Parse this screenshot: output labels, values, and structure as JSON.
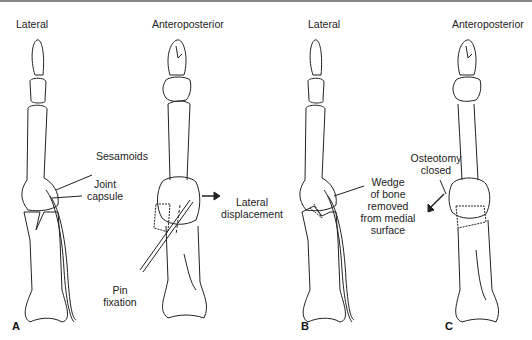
{
  "figure": {
    "panels": [
      {
        "id": "A",
        "label": "A",
        "views": [
          {
            "title": "Lateral",
            "annotations": [
              "Sesamoids",
              "Joint",
              "capsule"
            ]
          },
          {
            "title": "Anteroposterior",
            "annotations": [
              "Lateral",
              "displacement",
              "Pin",
              "fixation"
            ]
          }
        ]
      },
      {
        "id": "B",
        "label": "B",
        "views": [
          {
            "title": "Lateral",
            "annotations": [
              "Wedge",
              "of bone",
              "removed",
              "from medial",
              "surface"
            ]
          }
        ]
      },
      {
        "id": "C",
        "label": "C",
        "views": [
          {
            "title": "Anteroposterior",
            "annotations": [
              "Osteotomy",
              "closed"
            ]
          }
        ]
      }
    ]
  }
}
